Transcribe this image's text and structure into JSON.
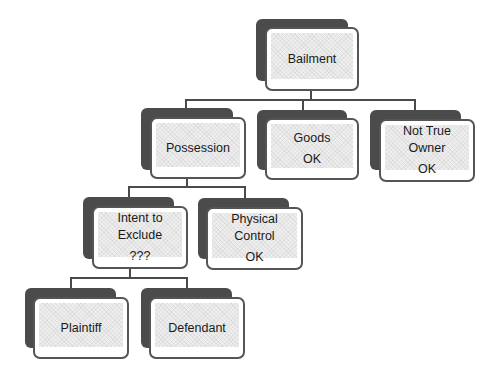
{
  "diagram": {
    "type": "hierarchy",
    "nodes": {
      "bailment": {
        "label": "Bailment",
        "status": ""
      },
      "possession": {
        "label": "Possession",
        "status": ""
      },
      "goods": {
        "label": "Goods",
        "status": "OK"
      },
      "not_true_owner": {
        "label": "Not True Owner",
        "line1": "Not True",
        "line2": "Owner",
        "status": "OK"
      },
      "intent_to_exclude": {
        "label": "Intent to Exclude",
        "line1": "Intent to",
        "line2": "Exclude",
        "status": "???"
      },
      "physical_control": {
        "label": "Physical Control",
        "line1": "Physical",
        "line2": "Control",
        "status": "OK"
      },
      "plaintiff": {
        "label": "Plaintiff",
        "status": ""
      },
      "defendant": {
        "label": "Defendant",
        "status": ""
      }
    },
    "edges": [
      [
        "bailment",
        "possession"
      ],
      [
        "bailment",
        "goods"
      ],
      [
        "bailment",
        "not_true_owner"
      ],
      [
        "possession",
        "intent_to_exclude"
      ],
      [
        "possession",
        "physical_control"
      ],
      [
        "intent_to_exclude",
        "plaintiff"
      ],
      [
        "intent_to_exclude",
        "defendant"
      ]
    ],
    "colors": {
      "shadow": "#4b4b4b",
      "border": "#555555",
      "fill": "#eeeeee",
      "connector": "#4a4a4a"
    }
  }
}
